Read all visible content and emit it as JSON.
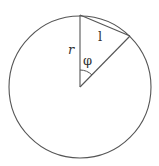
{
  "figure": {
    "type": "geometry-diagram",
    "colors": {
      "stroke": "#555555",
      "text": "#333333",
      "background": "#ffffff"
    },
    "circle": {
      "cx": 80,
      "cy": 87,
      "r": 71
    },
    "points": {
      "center": {
        "x": 80,
        "y": 87
      },
      "top": {
        "x": 80,
        "y": 15
      },
      "chord_end": {
        "x": 130,
        "y": 36
      }
    },
    "labels": {
      "radius": "r",
      "angle": "φ",
      "chord": "l"
    }
  }
}
